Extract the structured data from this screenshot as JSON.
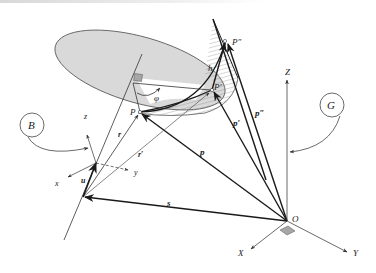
{
  "figure": {
    "type": "kinematics-vector-diagram",
    "frames": {
      "body": {
        "label": "B",
        "axes": [
          "x",
          "y",
          "z"
        ],
        "unit_vector": "u"
      },
      "global": {
        "label": "G",
        "axes": [
          "X",
          "Y",
          "Z"
        ],
        "origin": "O"
      }
    },
    "points": [
      "P",
      "P'",
      "P\""
    ],
    "vectors": {
      "r": "r",
      "r_prime": "r'",
      "s": "s",
      "p": "p",
      "p_prime": "p'",
      "p_double_prime": "p\""
    },
    "quantities": {
      "rotation_angle": "φ",
      "translation": "h"
    },
    "colors": {
      "disc_fill": "#d9d9d9",
      "stroke_dark": "#1a1a1a",
      "stroke_light": "#555555",
      "right_angle_marker": "#a6a6a6"
    }
  },
  "labels": {
    "B": "B",
    "G": "G",
    "x": "x",
    "y": "y",
    "z": "z",
    "X": "X",
    "Y": "Y",
    "Z": "Z",
    "O": "O",
    "u": "u",
    "r": "r",
    "r_prime": "r′",
    "s": "s",
    "p": "p",
    "p_prime": "p′",
    "p_double_prime": "p″",
    "P": "P",
    "P_prime": "P′",
    "P_double_prime": "P″",
    "phi": "φ",
    "h": "h"
  }
}
